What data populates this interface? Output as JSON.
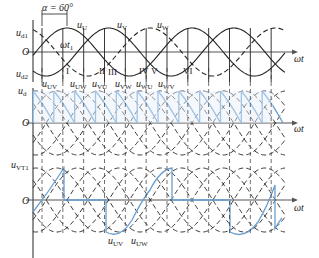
{
  "figure": {
    "type": "three-phase fully controlled bridge rectifier waveforms",
    "firing_angle_label": "α = 60°",
    "firing_angle_deg": 60,
    "colors": {
      "waveform": "#222222",
      "highlight": "#6a9fd0",
      "fill": "#e6f0fa",
      "axis": "#555555"
    }
  },
  "panels": [
    {
      "id": "phase-voltages",
      "y_label": "u_d1",
      "y_label_lower": "u_d2",
      "origin_label": "O",
      "x_label": "ωt",
      "time_marker": "ωt1",
      "curves": [
        "u_U",
        "u_V",
        "u_W"
      ],
      "segment_marks": [
        "I",
        "II",
        "III",
        "IV",
        "V",
        "VI"
      ]
    },
    {
      "id": "output-voltage",
      "y_label": "u_d",
      "origin_label": "O",
      "x_label": "ωt",
      "line_voltage_labels": [
        "u_UV",
        "u_UW",
        "u_VW",
        "u_VU",
        "u_WU",
        "u_WV"
      ]
    },
    {
      "id": "thyristor-voltage",
      "y_label": "u_VT1",
      "origin_label": "O",
      "x_label": "ωt",
      "bottom_labels": [
        "u_UV",
        "u_UW"
      ]
    }
  ],
  "labels": {
    "alpha": "α = 60°",
    "ud1": "u",
    "ud1_sub": "d1",
    "ud2": "u",
    "ud2_sub": "d2",
    "ud": "u",
    "ud_sub": "d",
    "uvt1": "u",
    "uvt1_sub": "VT1",
    "uU": "u",
    "uU_sub": "U",
    "uV": "u",
    "uV_sub": "V",
    "uW": "u",
    "uW_sub": "W",
    "wt1": "ωt",
    "wt1_sub": "1",
    "origin": "O",
    "wt": "ωt",
    "uUV": "u",
    "uUV_sub": "UV",
    "uUW": "u",
    "uUW_sub": "UW",
    "uVW": "u",
    "uVW_sub": "VW",
    "uVU": "u",
    "uVU_sub": "VU",
    "uWU": "u",
    "uWU_sub": "WU",
    "uWV": "u",
    "uWV_sub": "WV",
    "r1": "I",
    "r2": "II",
    "r3": "III",
    "r4": "IV",
    "r5": "V",
    "r6": "VI"
  }
}
